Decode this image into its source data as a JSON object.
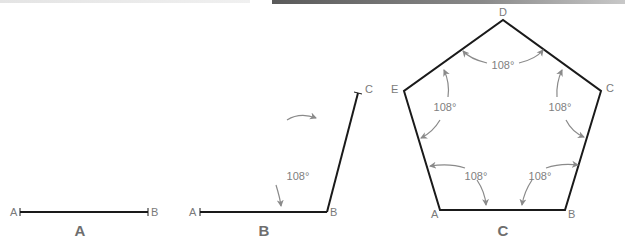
{
  "figures": [
    {
      "id": "A",
      "caption": "A",
      "description": "Line segment AB",
      "points": {
        "A": "A",
        "B": "B"
      }
    },
    {
      "id": "B",
      "caption": "B",
      "description": "Segments AB and BC forming a 108° angle at B",
      "points": {
        "A": "A",
        "B": "B",
        "C": "C"
      },
      "angles": [
        {
          "vertex": "B",
          "label": "108°"
        }
      ]
    },
    {
      "id": "C",
      "caption": "C",
      "description": "Regular pentagon ABCDE with all interior angles 108°",
      "points": {
        "A": "A",
        "B": "B",
        "C": "C",
        "D": "D",
        "E": "E"
      },
      "angles": [
        {
          "vertex": "D",
          "label": "108°"
        },
        {
          "vertex": "E",
          "label": "108°"
        },
        {
          "vertex": "C",
          "label": "108°"
        },
        {
          "vertex": "A",
          "label": "108°"
        },
        {
          "vertex": "B",
          "label": "108°"
        }
      ]
    }
  ],
  "colors": {
    "edge": "#1a1a1a",
    "arc": "#8a8a8a",
    "label": "#7a7a7a"
  }
}
